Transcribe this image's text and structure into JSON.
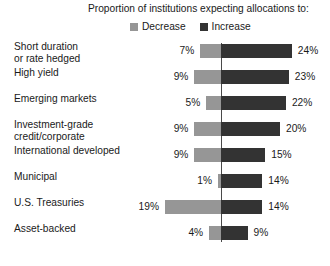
{
  "chart_data": {
    "type": "bar",
    "title": "Proportion of institutions expecting allocations to:",
    "subtitle": "",
    "xlabel": "",
    "ylabel": "",
    "orientation": "horizontal",
    "layout": "diverging",
    "grid": false,
    "legend_position": "top",
    "xlim": [
      -20,
      25
    ],
    "categories": [
      "Short duration\nor rate hedged",
      "High yield",
      "Emerging markets",
      "Investment-grade\ncredit/corporate",
      "International developed",
      "Municipal",
      "U.S. Treasuries",
      "Asset-backed"
    ],
    "series": [
      {
        "name": "Decrease",
        "color": "#969696",
        "direction": "left",
        "values": [
          7,
          9,
          5,
          9,
          9,
          1,
          19,
          4
        ],
        "labels": [
          "7%",
          "9%",
          "5%",
          "9%",
          "9%",
          "1%",
          "19%",
          "4%"
        ]
      },
      {
        "name": "Increase",
        "color": "#333333",
        "direction": "right",
        "values": [
          24,
          23,
          22,
          20,
          15,
          14,
          14,
          9
        ],
        "labels": [
          "24%",
          "23%",
          "22%",
          "20%",
          "15%",
          "14%",
          "14%",
          "9%"
        ]
      }
    ]
  },
  "legend": {
    "items": [
      {
        "label": "Decrease",
        "swatch": "decrease"
      },
      {
        "label": "Increase",
        "swatch": "increase"
      }
    ]
  },
  "colors": {
    "decrease": "#969696",
    "increase": "#333333",
    "axis": "#4a4a4a",
    "text": "#1a1a1a",
    "background": "#ffffff"
  }
}
